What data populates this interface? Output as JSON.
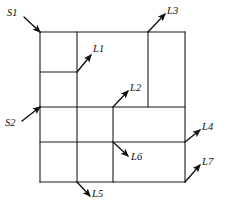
{
  "figure": {
    "type": "line-diagram",
    "background_color": "#ffffff",
    "line_color": "#1a1a1a",
    "label_color": "#111111",
    "outer_boundary": {
      "left": 40,
      "top": 32,
      "right": 185,
      "bottom": 182
    },
    "segments": [
      {
        "name": "outer-top",
        "x1": 40,
        "y1": 32,
        "x2": 185,
        "y2": 32
      },
      {
        "name": "outer-bottom",
        "x1": 40,
        "y1": 182,
        "x2": 185,
        "y2": 182
      },
      {
        "name": "outer-left",
        "x1": 40,
        "y1": 32,
        "x2": 40,
        "y2": 182
      },
      {
        "name": "outer-right",
        "x1": 185,
        "y1": 32,
        "x2": 185,
        "y2": 182
      },
      {
        "name": "interior-horizontal-upper-short",
        "x1": 40,
        "y1": 72,
        "x2": 77,
        "y2": 72
      },
      {
        "name": "interior-horizontal-middle-full",
        "x1": 40,
        "y1": 107,
        "x2": 185,
        "y2": 107
      },
      {
        "name": "interior-horizontal-lower-full",
        "x1": 40,
        "y1": 142,
        "x2": 185,
        "y2": 142
      },
      {
        "name": "interior-vertical-left",
        "x1": 77,
        "y1": 32,
        "x2": 77,
        "y2": 182
      },
      {
        "name": "interior-vertical-center",
        "x1": 113,
        "y1": 107,
        "x2": 113,
        "y2": 182
      },
      {
        "name": "interior-vertical-right-upper",
        "x1": 148,
        "y1": 32,
        "x2": 148,
        "y2": 107
      }
    ],
    "labels": [
      {
        "id": "S1",
        "text": "S1",
        "x": 7,
        "y": 8,
        "arrow": {
          "x1": 24,
          "y1": 17,
          "x2": 40,
          "y2": 32
        }
      },
      {
        "id": "S2",
        "text": "S2",
        "x": 5,
        "y": 118,
        "arrow": {
          "x1": 22,
          "y1": 121,
          "x2": 40,
          "y2": 107
        }
      },
      {
        "id": "L1",
        "text": "L1",
        "x": 93,
        "y": 44,
        "arrow": {
          "x1": 77,
          "y1": 72,
          "x2": 91,
          "y2": 55
        }
      },
      {
        "id": "L2",
        "text": "L2",
        "x": 130,
        "y": 83,
        "arrow": {
          "x1": 113,
          "y1": 107,
          "x2": 128,
          "y2": 91
        }
      },
      {
        "id": "L3",
        "text": "L3",
        "x": 167,
        "y": 6,
        "arrow": {
          "x1": 148,
          "y1": 32,
          "x2": 165,
          "y2": 14
        }
      },
      {
        "id": "L4",
        "text": "L4",
        "x": 202,
        "y": 122,
        "arrow": {
          "x1": 185,
          "y1": 142,
          "x2": 200,
          "y2": 130
        }
      },
      {
        "id": "L5",
        "text": "L5",
        "x": 92,
        "y": 189,
        "arrow": {
          "x1": 77,
          "y1": 182,
          "x2": 90,
          "y2": 196
        }
      },
      {
        "id": "L6",
        "text": "L6",
        "x": 131,
        "y": 152,
        "arrow": {
          "x1": 113,
          "y1": 142,
          "x2": 128,
          "y2": 156
        }
      },
      {
        "id": "L7",
        "text": "L7",
        "x": 202,
        "y": 157,
        "arrow": {
          "x1": 185,
          "y1": 182,
          "x2": 200,
          "y2": 165
        }
      }
    ]
  }
}
